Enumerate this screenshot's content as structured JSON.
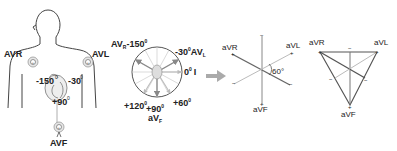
{
  "panel_body": {
    "leads": [
      {
        "name": "AVR",
        "angle": "-150",
        "deg": "0"
      },
      {
        "name": "AVL",
        "angle": "-30",
        "deg": "0"
      },
      {
        "name": "AVF",
        "angle": "+90",
        "deg": "0"
      }
    ]
  },
  "panel_circle": {
    "labels": {
      "avr_prefix": "AV",
      "avr_sub": "R",
      "avr_angle": "-150",
      "avl_angle": "-30",
      "avl_prefix": "AV",
      "avl_sub": "L",
      "lead1_angle": "0",
      "lead1_name": "I",
      "angle_120": "+120",
      "angle_90": "+90",
      "angle_60": "+60",
      "avf_prefix": "aV",
      "avf_sub": "F",
      "deg": "0"
    }
  },
  "panel_axes": {
    "avr": "aVR",
    "avl": "aVL",
    "avf": "aVF",
    "angle": "60°",
    "plus": "+",
    "minus": "−"
  },
  "panel_triangle": {
    "avr": "aVR",
    "avl": "aVL",
    "avf": "aVF",
    "plus": "+",
    "minus": "−"
  },
  "colors": {
    "line_dark": "#555555",
    "line_light": "#aaaaaa",
    "arrow": "#999999",
    "text": "#222222"
  }
}
